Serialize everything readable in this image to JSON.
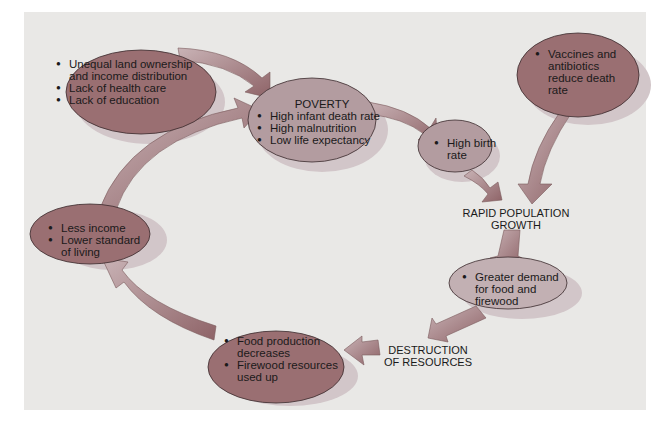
{
  "diagram": {
    "colors": {
      "background_panel": "#e9e8e6",
      "dark_ellipse": "#9a6f72",
      "light_ellipse": "#b9a2a6",
      "shadow": "#cfc2c6",
      "arrow": "#a27c80"
    },
    "nodes": {
      "causes": {
        "items": [
          "Unequal land ownership",
          "and income distribution",
          "Lack of health care",
          "Lack of education"
        ]
      },
      "poverty": {
        "heading": "POVERTY",
        "items": [
          "High infant death rate",
          "High malnutrition",
          "Low life expectancy"
        ]
      },
      "birth": {
        "items": [
          "High birth",
          "rate"
        ]
      },
      "vaccines": {
        "items": [
          "Vaccines and",
          "antibiotics",
          "reduce death",
          "rate"
        ]
      },
      "growth_label": [
        "RAPID POPULATION",
        "GROWTH"
      ],
      "demand": {
        "items": [
          "Greater demand",
          "for food and",
          "firewood"
        ]
      },
      "destruction_label": [
        "DESTRUCTION",
        "OF RESOURCES"
      ],
      "food": {
        "items": [
          "Food production",
          "decreases",
          "Firewood resources",
          "used up"
        ]
      },
      "income": {
        "items": [
          "Less income",
          "Lower standard",
          "of living"
        ]
      }
    }
  }
}
